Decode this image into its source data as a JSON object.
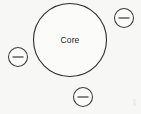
{
  "diagram": {
    "background_color": "#f7f7f6",
    "stroke_color": "#2b2b2b",
    "core_node": {
      "label": "Core",
      "cx": 70,
      "cy": 40,
      "r": 36.5
    },
    "collapse_buttons": [
      {
        "name": "collapse-button-top-right",
        "glyph": "minus-icon",
        "cx": 124,
        "cy": 18,
        "r": 9.5
      },
      {
        "name": "collapse-button-left",
        "glyph": "minus-icon",
        "cx": 18,
        "cy": 57,
        "r": 9.5
      },
      {
        "name": "collapse-button-bottom",
        "glyph": "minus-icon",
        "cx": 83,
        "cy": 97,
        "r": 9.5
      }
    ]
  }
}
